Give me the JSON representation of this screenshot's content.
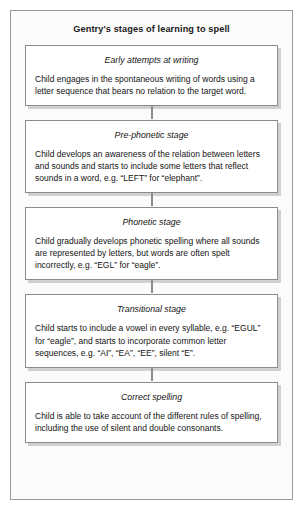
{
  "figure": {
    "title": "Gentry's stages of learning to spell",
    "background_color": "#fbfbfb",
    "border_color": "#9a9a9a",
    "box_border_color": "#8c8c8c",
    "box_fill_color": "#ffffff",
    "text_color": "#141414"
  },
  "chart_data": {
    "type": "diagram",
    "title": "Gentry's stages of learning to spell",
    "layout": "vertical flowchart, five stacked boxes connected top-to-bottom by short vertical lines",
    "stages": [
      {
        "order": 1,
        "title": "Early attempts at writing",
        "body": "Child engages in the spontaneous writing of words using a letter sequence that bears no relation to the target word."
      },
      {
        "order": 2,
        "title": "Pre-phonetic stage",
        "body": "Child develops an awareness of the relation between letters and sounds and starts to include some letters that reflect sounds in a word, e.g. “LEFT” for “elephant”."
      },
      {
        "order": 3,
        "title": "Phonetic stage",
        "body": "Child gradually develops phonetic spelling where all sounds are represented by letters, but words are often spelt incorrectly, e.g. “EGL” for “eagle”."
      },
      {
        "order": 4,
        "title": "Transitional stage",
        "body": "Child starts to include a vowel in every syllable, e.g. “EGUL” for “eagle”, and starts to incorporate common letter sequences, e.g. “AI”, “EA”, “EE”, silent “E”."
      },
      {
        "order": 5,
        "title": "Correct spelling",
        "body": "Child is able to take account of the different rules of spelling, including the use of silent and double consonants."
      }
    ]
  }
}
